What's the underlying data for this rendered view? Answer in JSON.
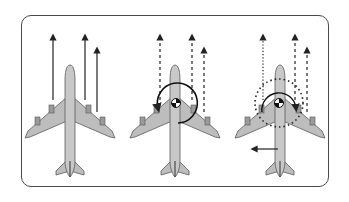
{
  "diagram": {
    "type": "aircraft-thrust-yaw-illustration",
    "colors": {
      "frame": "#4a4a4a",
      "arrow": "#222222",
      "fuselage_fill": "#c8c8c8",
      "fuselage_stroke": "#5a5a5a",
      "wing_fill": "#bdbdbd",
      "cg_dark": "#1a1a1a",
      "cg_light": "#ffffff"
    },
    "panels": [
      {
        "id": "symmetric-thrust",
        "plane_center_x": 70,
        "thrust_arrows": [
          {
            "x": 53,
            "y_top": 35,
            "y_bottom": 100,
            "style": "solid"
          },
          {
            "x": 85,
            "y_top": 35,
            "y_bottom": 100,
            "style": "solid"
          },
          {
            "x": 97,
            "y_top": 48,
            "y_bottom": 110,
            "style": "solid"
          }
        ],
        "has_cg": false,
        "rotation": "none"
      },
      {
        "id": "asymmetric-thrust-yaw",
        "plane_center_x": 175,
        "thrust_arrows": [
          {
            "x": 160,
            "y_top": 35,
            "y_bottom": 100,
            "style": "dashed"
          },
          {
            "x": 192,
            "y_top": 35,
            "y_bottom": 100,
            "style": "dashed"
          },
          {
            "x": 204,
            "y_top": 48,
            "y_bottom": 110,
            "style": "dashed"
          }
        ],
        "has_cg": true,
        "rotation": "counterclockwise-arc"
      },
      {
        "id": "rudder-correction",
        "plane_center_x": 280,
        "thrust_arrows": [
          {
            "x": 263,
            "y_top": 35,
            "y_bottom": 100,
            "style": "dotted"
          },
          {
            "x": 295,
            "y_top": 35,
            "y_bottom": 100,
            "style": "dashed"
          },
          {
            "x": 307,
            "y_top": 48,
            "y_bottom": 110,
            "style": "dashed"
          }
        ],
        "has_cg": true,
        "rotation": "opposing-arcs",
        "tail_force_arrow": {
          "x_from": 278,
          "x_to": 252,
          "y": 149
        }
      }
    ]
  }
}
